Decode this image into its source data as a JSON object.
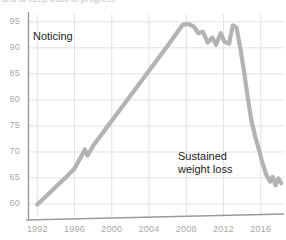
{
  "caption_cut": "and to keep track of progress",
  "annotations": [
    {
      "id": "noticing",
      "text": "Noticing"
    },
    {
      "id": "sustained",
      "line1": "Sustained",
      "line2": "weight loss"
    }
  ],
  "colors": {
    "line": "#b3b3b3",
    "grid": "#e2e2e8",
    "axis": "#9a9a9a",
    "tick_label": "#a9a9a9",
    "annotation": "#1c1c1c"
  },
  "chart_data": {
    "type": "line",
    "title": "",
    "subtitle": "",
    "xlabel": "",
    "ylabel": "",
    "xlim": [
      1991,
      2018.5
    ],
    "ylim": [
      57.5,
      96.5
    ],
    "grid": true,
    "legend": "none",
    "xticks": [
      "1992",
      "1996",
      "2000",
      "2004",
      "2008",
      "2012",
      "2016"
    ],
    "xtick_values": [
      1992,
      1996,
      2000,
      2004,
      2008,
      2012,
      2016
    ],
    "yticks": [
      "60",
      "65",
      "70",
      "75",
      "80",
      "85",
      "90",
      "95"
    ],
    "ytick_values": [
      60,
      65,
      70,
      75,
      80,
      85,
      90,
      95
    ],
    "series": [
      {
        "name": "Weight",
        "x": [
          1992,
          1993,
          1994,
          1995,
          1996,
          1996.8,
          1997.1,
          1997.4,
          1998,
          1999,
          2000,
          2001,
          2002,
          2003,
          2004,
          2005,
          2006,
          2007,
          2007.6,
          2008.2,
          2008.8,
          2009.3,
          2009.8,
          2010.3,
          2010.8,
          2011.2,
          2011.7,
          2012.1,
          2012.6,
          2013.0,
          2013.4,
          2013.8,
          2014.2,
          2014.6,
          2015.0,
          2015.4,
          2015.8,
          2016.2,
          2016.6,
          2017.0,
          2017.3,
          2017.6,
          2017.9,
          2018.2
        ],
        "y": [
          59.9,
          61.6,
          63.3,
          65.0,
          66.8,
          69.4,
          70.5,
          69.3,
          71.2,
          73.6,
          76.0,
          78.4,
          80.8,
          83.2,
          85.6,
          88.0,
          90.4,
          92.9,
          94.4,
          94.6,
          94.1,
          92.8,
          93.1,
          91.0,
          92.0,
          90.6,
          92.8,
          91.2,
          90.8,
          94.3,
          93.9,
          90.0,
          85.5,
          80.5,
          76.0,
          73.0,
          70.5,
          67.8,
          65.6,
          64.3,
          65.2,
          63.6,
          64.9,
          64.0
        ]
      }
    ]
  }
}
